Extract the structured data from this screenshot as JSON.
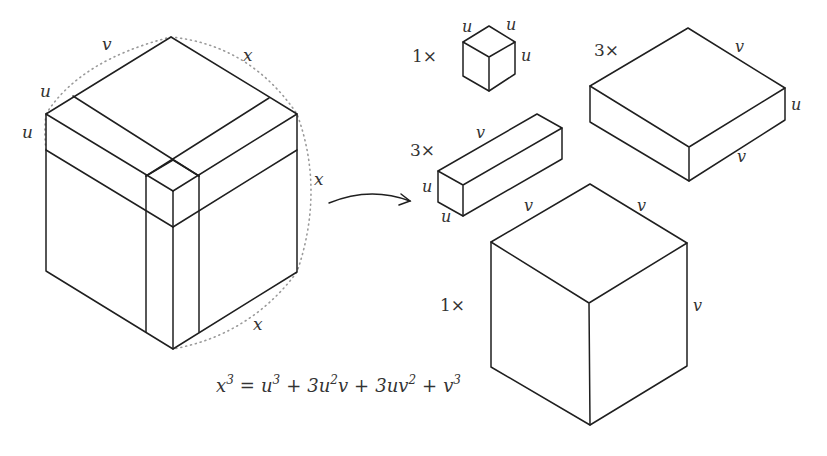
{
  "diagram": {
    "big_cube": {
      "labels": {
        "top_left_v": "v",
        "top_left_u": "u",
        "left_u": "u",
        "top_right_x": "x",
        "right_x": "x",
        "bottom_x": "x"
      }
    },
    "pieces": [
      {
        "id": "u-cube",
        "multiplier": "1×",
        "labels": [
          "u",
          "u",
          "u"
        ]
      },
      {
        "id": "u2v-rod",
        "multiplier": "3×",
        "labels": [
          "v",
          "u",
          "u"
        ]
      },
      {
        "id": "uv2-slab",
        "multiplier": "3×",
        "labels": [
          "v",
          "u",
          "v"
        ]
      },
      {
        "id": "v-cube",
        "multiplier": "1×",
        "labels": [
          "v",
          "v",
          "v"
        ]
      }
    ],
    "equation": {
      "lhs": "x",
      "lhs_exp": "3",
      "eq": "=",
      "t1": "u",
      "t1_exp": "3",
      "plus1": "+",
      "t2_coef": "3",
      "t2_a": "u",
      "t2_a_exp": "2",
      "t2_b": "v",
      "plus2": "+",
      "t3_coef": "3",
      "t3_a": "uv",
      "t3_a_exp": "2",
      "plus3": "+",
      "t4": "v",
      "t4_exp": "3"
    },
    "colors": {
      "line": "#1f1f1f",
      "dotted": "#9a9a9a",
      "text": "#333333",
      "background": "#ffffff"
    }
  }
}
